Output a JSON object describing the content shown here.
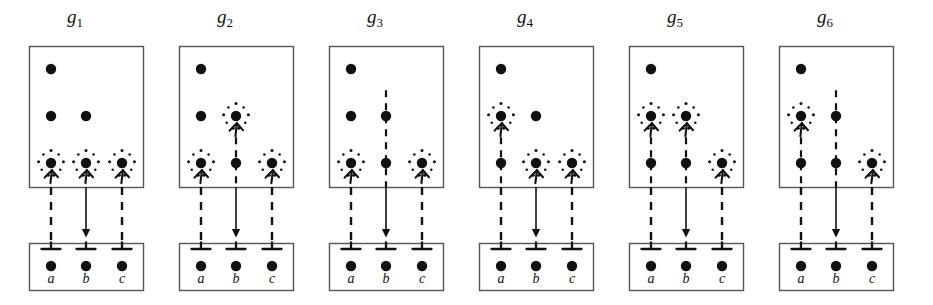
{
  "figure": {
    "kind": "parse-forest-diagram",
    "panel_count": 6,
    "colors": {
      "ink": "#111111",
      "box_stroke": "#555555",
      "background": "#ffffff"
    },
    "geometry": {
      "panel_width": 150,
      "panel_pitch": 150,
      "top_box": {
        "x": 29,
        "y": 46,
        "w": 114,
        "h": 141
      },
      "bottom_box": {
        "x": 29,
        "y": 243,
        "w": 114,
        "h": 47
      },
      "columns_x": [
        51,
        86,
        122
      ],
      "rows_y": [
        69,
        116,
        163
      ],
      "terminal_y": 266,
      "node_radius": 5.2,
      "halo_radius": 12.5,
      "halo_dot_count": 9
    },
    "legend": {
      "halo": "sparkle-ring marks a highlighted node",
      "up_arrow": "arrow entering a highlighted node from below",
      "dashed_line": "dashed derivation link down to the terminal",
      "solid_arrow": "solid arrow on the middle column",
      "tee": "perpendicular tee marker on the terminal box edge"
    },
    "terminals": {
      "labels": [
        "a",
        "b",
        "c"
      ]
    },
    "nodes": {
      "row1": [
        "b"
      ],
      "row2": [
        "a",
        "b"
      ],
      "row3": [
        "a",
        "b",
        "c"
      ]
    },
    "panels": [
      {
        "id": "g1",
        "title_base": "g",
        "title_sub": "1",
        "highlights": [
          {
            "row": 3,
            "col": 0
          },
          {
            "row": 3,
            "col": 1
          },
          {
            "row": 3,
            "col": 2
          }
        ],
        "internal_dashes": []
      },
      {
        "id": "g2",
        "title_base": "g",
        "title_sub": "2",
        "highlights": [
          {
            "row": 2,
            "col": 1
          },
          {
            "row": 3,
            "col": 0
          },
          {
            "row": 3,
            "col": 2
          }
        ],
        "internal_dashes": [
          {
            "col": 1,
            "from_row": 2
          }
        ]
      },
      {
        "id": "g3",
        "title_base": "g",
        "title_sub": "3",
        "highlights": [
          {
            "row": 1,
            "col": 1
          },
          {
            "row": 3,
            "col": 0
          },
          {
            "row": 3,
            "col": 2
          }
        ],
        "internal_dashes": [
          {
            "col": 1,
            "from_row": 1
          }
        ]
      },
      {
        "id": "g4",
        "title_base": "g",
        "title_sub": "4",
        "highlights": [
          {
            "row": 2,
            "col": 0
          },
          {
            "row": 3,
            "col": 1
          },
          {
            "row": 3,
            "col": 2
          }
        ],
        "internal_dashes": [
          {
            "col": 0,
            "from_row": 2
          }
        ]
      },
      {
        "id": "g5",
        "title_base": "g",
        "title_sub": "5",
        "highlights": [
          {
            "row": 2,
            "col": 0
          },
          {
            "row": 2,
            "col": 1
          },
          {
            "row": 3,
            "col": 2
          }
        ],
        "internal_dashes": [
          {
            "col": 0,
            "from_row": 2
          },
          {
            "col": 1,
            "from_row": 2
          }
        ]
      },
      {
        "id": "g6",
        "title_base": "g",
        "title_sub": "6",
        "highlights": [
          {
            "row": 1,
            "col": 1
          },
          {
            "row": 2,
            "col": 0
          },
          {
            "row": 3,
            "col": 2
          }
        ],
        "internal_dashes": [
          {
            "col": 1,
            "from_row": 1
          },
          {
            "col": 0,
            "from_row": 2
          }
        ]
      }
    ]
  }
}
